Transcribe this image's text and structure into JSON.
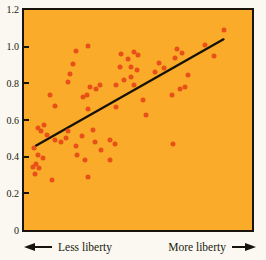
{
  "figure": {
    "background_color": "#FAF8F1",
    "plot_background_color": "#F9AB29",
    "dot_color": "#E8501A",
    "trend_line_color": "#17120B",
    "axis_color": "#1A140C"
  },
  "chart_data": {
    "type": "scatter",
    "title": "",
    "xlabel_left": "Less liberty",
    "xlabel_right": "More liberty",
    "ylim": [
      0,
      1.2
    ],
    "xlim_percent": [
      0,
      100
    ],
    "grid": false,
    "yticks": [
      0,
      0.2,
      0.4,
      0.6,
      0.8,
      1.0,
      1.2
    ],
    "ytick_labels": [
      "0",
      "0.2",
      "0.4",
      "0.6",
      "0.8",
      "1.0",
      "1.2"
    ],
    "trendline": {
      "x1": 5.2,
      "y1": 0.46,
      "x2": 87.5,
      "y2": 1.04
    },
    "points": [
      {
        "x": 27.9,
        "y": 1.005
      },
      {
        "x": 22.9,
        "y": 0.975
      },
      {
        "x": 21.3,
        "y": 0.905
      },
      {
        "x": 20.3,
        "y": 0.85
      },
      {
        "x": 19.4,
        "y": 0.805
      },
      {
        "x": 42.5,
        "y": 0.96
      },
      {
        "x": 45.4,
        "y": 0.935
      },
      {
        "x": 42.1,
        "y": 0.89
      },
      {
        "x": 46.9,
        "y": 0.835
      },
      {
        "x": 44.0,
        "y": 0.82
      },
      {
        "x": 28.9,
        "y": 0.78
      },
      {
        "x": 31.5,
        "y": 0.77
      },
      {
        "x": 33.2,
        "y": 0.79
      },
      {
        "x": 26.0,
        "y": 0.725
      },
      {
        "x": 27.6,
        "y": 0.735
      },
      {
        "x": 40.4,
        "y": 0.79
      },
      {
        "x": 48.3,
        "y": 0.79
      },
      {
        "x": 11.6,
        "y": 0.735
      },
      {
        "x": 13.8,
        "y": 0.675
      },
      {
        "x": 28.1,
        "y": 0.66
      },
      {
        "x": 40.4,
        "y": 0.67
      },
      {
        "x": 48.3,
        "y": 0.97
      },
      {
        "x": 50.2,
        "y": 0.952
      },
      {
        "x": 46.9,
        "y": 0.89
      },
      {
        "x": 49.4,
        "y": 0.875
      },
      {
        "x": 59.4,
        "y": 0.91
      },
      {
        "x": 61.2,
        "y": 0.885
      },
      {
        "x": 57.5,
        "y": 0.86
      },
      {
        "x": 67.2,
        "y": 0.99
      },
      {
        "x": 69.4,
        "y": 0.963
      },
      {
        "x": 66.2,
        "y": 0.936
      },
      {
        "x": 71.8,
        "y": 0.845
      },
      {
        "x": 70.6,
        "y": 0.78
      },
      {
        "x": 68.4,
        "y": 0.77
      },
      {
        "x": 65.1,
        "y": 0.737
      },
      {
        "x": 52.4,
        "y": 0.71
      },
      {
        "x": 53.7,
        "y": 0.627
      },
      {
        "x": 87.8,
        "y": 1.09
      },
      {
        "x": 79.6,
        "y": 1.01
      },
      {
        "x": 83.5,
        "y": 0.95
      },
      {
        "x": 65.5,
        "y": 0.467
      },
      {
        "x": 8.6,
        "y": 0.575
      },
      {
        "x": 7.6,
        "y": 0.54
      },
      {
        "x": 9.9,
        "y": 0.52
      },
      {
        "x": 6.3,
        "y": 0.555
      },
      {
        "x": 13.8,
        "y": 0.49
      },
      {
        "x": 16.4,
        "y": 0.478
      },
      {
        "x": 18.4,
        "y": 0.5
      },
      {
        "x": 19.5,
        "y": 0.54
      },
      {
        "x": 25.3,
        "y": 0.515
      },
      {
        "x": 30.3,
        "y": 0.545
      },
      {
        "x": 31.0,
        "y": 0.48
      },
      {
        "x": 37.5,
        "y": 0.49
      },
      {
        "x": 39.7,
        "y": 0.467
      },
      {
        "x": 22.6,
        "y": 0.456
      },
      {
        "x": 23.1,
        "y": 0.407
      },
      {
        "x": 33.9,
        "y": 0.435
      },
      {
        "x": 26.7,
        "y": 0.38
      },
      {
        "x": 37.5,
        "y": 0.38
      },
      {
        "x": 28.1,
        "y": 0.289
      },
      {
        "x": 12.4,
        "y": 0.275
      },
      {
        "x": 4.3,
        "y": 0.447
      },
      {
        "x": 6.0,
        "y": 0.409
      },
      {
        "x": 8.3,
        "y": 0.392
      },
      {
        "x": 5.2,
        "y": 0.36
      },
      {
        "x": 4.0,
        "y": 0.345
      },
      {
        "x": 6.7,
        "y": 0.337
      },
      {
        "x": 4.7,
        "y": 0.307
      }
    ]
  }
}
